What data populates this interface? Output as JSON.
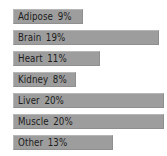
{
  "chart_data": {
    "type": "bar",
    "orientation": "horizontal",
    "title": "",
    "subtitle": "",
    "xlabel": "",
    "ylabel": "",
    "grid": false,
    "legend": null,
    "axis_visible": false,
    "value_suffix": "%",
    "xlim": [
      0,
      20
    ],
    "categories": [
      "Adipose",
      "Brain",
      "Heart",
      "Kidney",
      "Liver",
      "Muscle",
      "Other"
    ],
    "values": [
      9,
      19,
      11,
      8,
      20,
      20,
      13
    ],
    "bars": [
      {
        "label": "Adipose",
        "value": "9%",
        "pixel_width": 70,
        "top": 9
      },
      {
        "label": "Brain",
        "value": "19%",
        "pixel_width": 146,
        "top": 30
      },
      {
        "label": "Heart",
        "value": "11%",
        "pixel_width": 87,
        "top": 51
      },
      {
        "label": "Kidney",
        "value": "8%",
        "pixel_width": 63,
        "top": 72
      },
      {
        "label": "Liver",
        "value": "20%",
        "pixel_width": 151,
        "top": 93
      },
      {
        "label": "Muscle",
        "value": "20%",
        "pixel_width": 151,
        "top": 114
      },
      {
        "label": "Other",
        "value": "13%",
        "pixel_width": 100,
        "top": 135
      }
    ],
    "colors": {
      "bar_fill": "#9d9d9d",
      "bar_border_light": "#b6b6b6",
      "bar_border_dark": "#8f8f8f",
      "text": "#1c1c1c",
      "background": "#ffffff"
    }
  }
}
